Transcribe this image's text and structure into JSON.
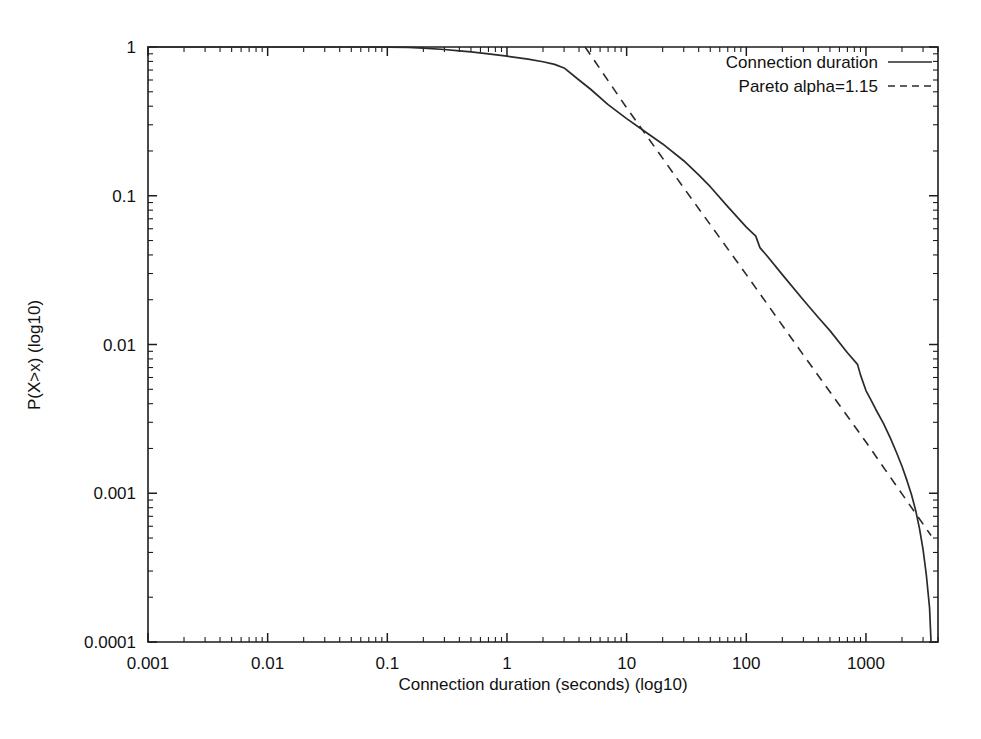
{
  "figure": {
    "background": "#ffffff",
    "ink_color": "#2a2a2a",
    "caption": ""
  },
  "chart_data": {
    "type": "line",
    "title": "",
    "xlabel": "Connection duration (seconds) (log10)",
    "ylabel": "P(X>x) (log10)",
    "xscale": "log",
    "yscale": "log",
    "xlim": [
      0.001,
      4000
    ],
    "ylim": [
      0.0001,
      1
    ],
    "grid": false,
    "legend_position": "top-right",
    "xticks": [
      0.001,
      0.01,
      0.1,
      1,
      10,
      100,
      1000
    ],
    "xtick_labels": [
      "0.001",
      "0.01",
      "0.1",
      "1",
      "10",
      "100",
      "1000"
    ],
    "yticks": [
      0.0001,
      0.001,
      0.01,
      0.1,
      1
    ],
    "ytick_labels": [
      "0.0001",
      "0.001",
      "0.01",
      "0.1",
      "1"
    ],
    "series": [
      {
        "name": "Connection duration",
        "style": "solid",
        "points": [
          [
            0.001,
            1.0
          ],
          [
            0.01,
            1.0
          ],
          [
            0.05,
            1.0
          ],
          [
            0.1,
            0.998
          ],
          [
            0.15,
            0.993
          ],
          [
            0.2,
            0.983
          ],
          [
            0.3,
            0.962
          ],
          [
            0.4,
            0.943
          ],
          [
            0.5,
            0.928
          ],
          [
            0.7,
            0.9
          ],
          [
            1.0,
            0.868
          ],
          [
            1.5,
            0.828
          ],
          [
            2.0,
            0.796
          ],
          [
            2.5,
            0.764
          ],
          [
            3.0,
            0.723
          ],
          [
            4.0,
            0.6
          ],
          [
            5.0,
            0.52
          ],
          [
            7.0,
            0.41
          ],
          [
            10.0,
            0.33
          ],
          [
            15.0,
            0.262
          ],
          [
            20.0,
            0.223
          ],
          [
            30.0,
            0.172
          ],
          [
            40.0,
            0.138
          ],
          [
            50.0,
            0.115
          ],
          [
            70.0,
            0.0845
          ],
          [
            100.0,
            0.0615
          ],
          [
            120.0,
            0.0535
          ],
          [
            130.0,
            0.0448
          ],
          [
            150.0,
            0.0392
          ],
          [
            200.0,
            0.0295
          ],
          [
            300.0,
            0.0199
          ],
          [
            400.0,
            0.0152
          ],
          [
            500.0,
            0.0124
          ],
          [
            700.0,
            0.0088
          ],
          [
            850.0,
            0.00735
          ],
          [
            900.0,
            0.00625
          ],
          [
            1000.0,
            0.0049
          ],
          [
            1100.0,
            0.00425
          ],
          [
            1200.0,
            0.0037
          ],
          [
            1400.0,
            0.00295
          ],
          [
            1600.0,
            0.00235
          ],
          [
            1800.0,
            0.00188
          ],
          [
            2000.0,
            0.00152
          ],
          [
            2200.0,
            0.00122
          ],
          [
            2400.0,
            0.00098
          ],
          [
            2600.0,
            0.00077
          ],
          [
            2800.0,
            0.00058
          ],
          [
            3000.0,
            0.00042
          ],
          [
            3200.0,
            0.00028
          ],
          [
            3400.0,
            0.00017
          ],
          [
            3500.0,
            0.0001
          ]
        ]
      },
      {
        "name": "Pareto alpha=1.15",
        "style": "dashed",
        "alpha": 1.15,
        "points": [
          [
            4.5,
            1.0
          ],
          [
            10.0,
            0.39
          ],
          [
            30.0,
            0.113
          ],
          [
            100.0,
            0.0295
          ],
          [
            300.0,
            0.0085
          ],
          [
            1000.0,
            0.00221
          ],
          [
            2000.0,
            0.00099
          ],
          [
            3500.0,
            0.00052
          ]
        ]
      }
    ]
  },
  "legend": {
    "entries": [
      {
        "label": "Connection duration",
        "style": "solid"
      },
      {
        "label": "Pareto alpha=1.15",
        "style": "dashed"
      }
    ]
  }
}
